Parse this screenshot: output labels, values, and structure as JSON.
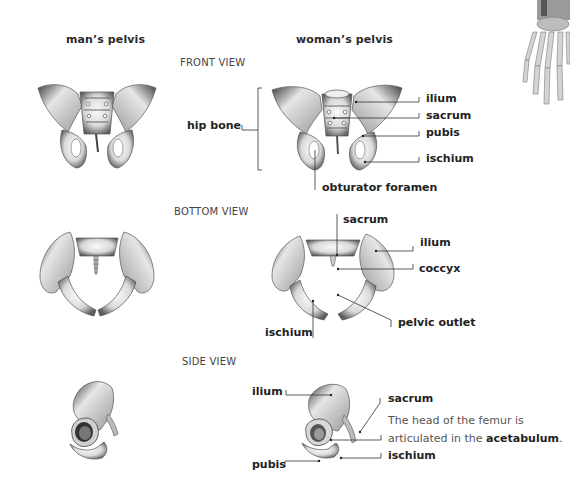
{
  "columns": {
    "man": "man’s pelvis",
    "woman": "woman’s pelvis"
  },
  "views": {
    "front": "FRONT VIEW",
    "bottom": "BOTTOM VIEW",
    "side": "SIDE VIEW"
  },
  "front_labels": {
    "hip_bone": "hip bone",
    "ilium": "ilium",
    "sacrum": "sacrum",
    "pubis": "pubis",
    "ischium": "ischium",
    "obturator_foramen": "obturator foramen"
  },
  "bottom_labels": {
    "sacrum": "sacrum",
    "ilium": "ilium",
    "coccyx": "coccyx",
    "pelvic_outlet": "pelvic outlet",
    "ischium": "ischium"
  },
  "side_labels": {
    "ilium": "ilium",
    "sacrum": "sacrum",
    "pubis": "pubis",
    "ischium": "ischium",
    "description_line1": "The head of the femur is",
    "description_line2_prefix": "articulated in the ",
    "description_line2_bold": "acetabulum",
    "description_line2_suffix": "."
  },
  "illustrations": [
    {
      "id": "man-front",
      "subject": "male pelvis front view"
    },
    {
      "id": "woman-front",
      "subject": "female pelvis front view"
    },
    {
      "id": "man-bottom",
      "subject": "male pelvis bottom view"
    },
    {
      "id": "woman-bottom",
      "subject": "female pelvis bottom view"
    },
    {
      "id": "man-side",
      "subject": "male hip bone side view"
    },
    {
      "id": "woman-side",
      "subject": "female hip bone side view"
    },
    {
      "id": "hand",
      "subject": "hand skeleton (partial, top-right corner)"
    }
  ],
  "colors": {
    "background": "#ffffff",
    "text": "#222222",
    "view_title": "#444444",
    "leader_line": "#333333",
    "bone_light": "#f2f2f2",
    "bone_shadow": "#6a6a6a"
  }
}
